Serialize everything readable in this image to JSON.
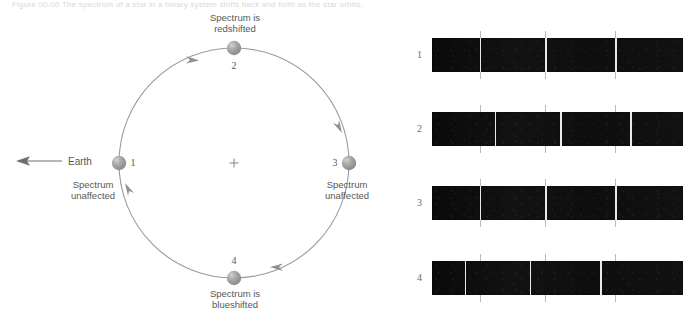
{
  "figure": {
    "cut_caption": "Figure 00-00  The spectrum of a star in a binary system shifts back and forth as the star orbits.",
    "center_marker": "+"
  },
  "orbit": {
    "earth_label": "Earth",
    "earth_arrow_icon": "left-arrow-icon",
    "positions": [
      {
        "number": "1",
        "caption": "Spectrum\nunaffected",
        "angle_deg": 180,
        "caption_pos": "below-left"
      },
      {
        "number": "2",
        "caption": "Spectrum is\nredshifted",
        "angle_deg": 270,
        "caption_pos": "above"
      },
      {
        "number": "3",
        "caption": "Spectrum\nunaffected",
        "angle_deg": 0,
        "caption_pos": "below-right"
      },
      {
        "number": "4",
        "caption": "Spectrum is\nblueshifted",
        "angle_deg": 90,
        "caption_pos": "below"
      }
    ],
    "direction": "clockwise",
    "geometry": {
      "cx": 234,
      "cy": 163,
      "r": 115
    },
    "colors": {
      "orbit_line": "#9a9a9a",
      "star_body": "#9b9b9b",
      "star_highlight": "#c9c9c9",
      "text": "#575757"
    }
  },
  "spectra": {
    "rest_line_positions_pct": [
      19.0,
      45.0,
      73.0
    ],
    "tick_positions_pct": [
      19.0,
      45.0,
      73.0
    ],
    "rows": [
      {
        "index": "1",
        "shift_pct": 0.0,
        "shift_type": "none",
        "top": 38,
        "left": 432,
        "width": 251,
        "height": 34
      },
      {
        "index": "2",
        "shift_pct": 6.0,
        "shift_type": "redshift",
        "top": 112,
        "left": 432,
        "width": 251,
        "height": 34
      },
      {
        "index": "3",
        "shift_pct": 0.0,
        "shift_type": "none",
        "top": 186,
        "left": 432,
        "width": 251,
        "height": 34
      },
      {
        "index": "4",
        "shift_pct": -6.0,
        "shift_type": "blueshift",
        "top": 261,
        "left": 432,
        "width": 251,
        "height": 34
      }
    ],
    "colors": {
      "background": "#0d0d0d",
      "line": "#e9e9e9",
      "tick": "#b9b9b9",
      "index_text": "#6a6a6a"
    }
  }
}
